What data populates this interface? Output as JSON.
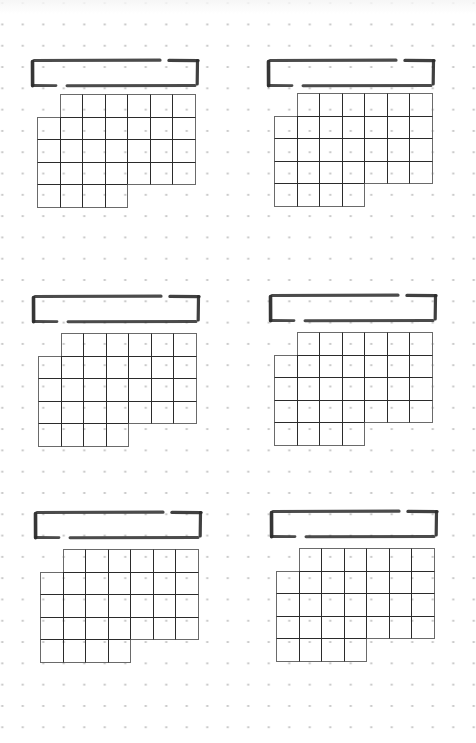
{
  "page": {
    "type": "dot-grid monthly calendar template page",
    "width": 476,
    "height": 743,
    "header_text": "",
    "colors": {
      "background": "#ffffff",
      "dots": "#c4c4c4",
      "ink": "#2b2b2b",
      "outer_edge": "#6a6a6a"
    },
    "dot_grid": {
      "spacing_x": 20.5,
      "spacing_y": 21.3
    }
  },
  "calendar_layout": {
    "columns": 7,
    "rows": 5,
    "cell_size": 22.5,
    "row_cells": [
      [
        1,
        2,
        3,
        4,
        5,
        6
      ],
      [
        0,
        1,
        2,
        3,
        4,
        5,
        6
      ],
      [
        0,
        1,
        2,
        3,
        4,
        5,
        6
      ],
      [
        0,
        1,
        2,
        3,
        4,
        5,
        6
      ],
      [
        0,
        1,
        2,
        3
      ]
    ]
  },
  "calendars": [
    {
      "id": "calendar-1",
      "month_title": "",
      "title_box": {
        "x": 32,
        "y": 60
      },
      "grid": {
        "x": 37,
        "y": 94
      }
    },
    {
      "id": "calendar-2",
      "month_title": "",
      "title_box": {
        "x": 268,
        "y": 60
      },
      "grid": {
        "x": 274,
        "y": 93
      }
    },
    {
      "id": "calendar-3",
      "month_title": "",
      "title_box": {
        "x": 33,
        "y": 296
      },
      "grid": {
        "x": 38,
        "y": 333
      }
    },
    {
      "id": "calendar-4",
      "month_title": "",
      "title_box": {
        "x": 270,
        "y": 295
      },
      "grid": {
        "x": 274,
        "y": 332
      }
    },
    {
      "id": "calendar-5",
      "month_title": "",
      "title_box": {
        "x": 35,
        "y": 512
      },
      "grid": {
        "x": 40,
        "y": 549
      }
    },
    {
      "id": "calendar-6",
      "month_title": "",
      "title_box": {
        "x": 271,
        "y": 511
      },
      "grid": {
        "x": 276,
        "y": 548
      }
    }
  ]
}
